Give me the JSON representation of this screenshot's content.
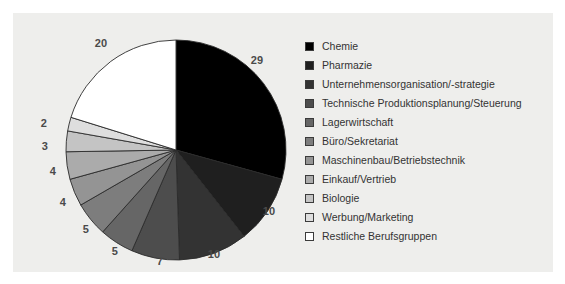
{
  "card": {
    "background_color": "#eeeeec",
    "page_background_color": "#ffffff"
  },
  "chart_data": {
    "type": "pie",
    "title": "",
    "subtitle": "",
    "xlabel": "",
    "ylabel": "",
    "grid": false,
    "legend_position": "right",
    "unit": "percent",
    "start_angle_deg": 0,
    "direction": "clockwise",
    "total": 99,
    "categories": [
      "Chemie",
      "Pharmazie",
      "Unternehmensorganisation/-strategie",
      "Technische Produktionsplanung/Steuerung",
      "Lagerwirtschaft",
      "Büro/Sekretariat",
      "Maschinenbau/Betriebstechnik",
      "Einkauf/Vertrieb",
      "Biologie",
      "Werbung/Marketing",
      "Restliche Berufsgruppen"
    ],
    "values": [
      29,
      10,
      10,
      7,
      5,
      5,
      4,
      4,
      3,
      2,
      20
    ],
    "colors": [
      "#000000",
      "#1f1f1f",
      "#333333",
      "#4d4d4d",
      "#666666",
      "#7d7d7d",
      "#949494",
      "#ababab",
      "#c4c4c4",
      "#dedede",
      "#ffffff"
    ],
    "slice_border_color": "#2b2b2b",
    "label_color": "#4a4a4a",
    "data_labels": [
      {
        "text": "29",
        "x": 244,
        "y": 47
      },
      {
        "text": "10",
        "x": 256,
        "y": 198
      },
      {
        "text": "10",
        "x": 201,
        "y": 241
      },
      {
        "text": "7",
        "x": 147,
        "y": 248
      },
      {
        "text": "5",
        "x": 102,
        "y": 238
      },
      {
        "text": "5",
        "x": 73,
        "y": 216
      },
      {
        "text": "4",
        "x": 50,
        "y": 189
      },
      {
        "text": "4",
        "x": 40,
        "y": 158
      },
      {
        "text": "3",
        "x": 32,
        "y": 133
      },
      {
        "text": "2",
        "x": 31,
        "y": 110
      },
      {
        "text": "20",
        "x": 88,
        "y": 30
      }
    ],
    "geometry": {
      "center_x": 163,
      "center_y": 137,
      "radius": 110
    }
  },
  "legend": {
    "items": [
      {
        "label": "Chemie",
        "color": "#000000"
      },
      {
        "label": "Pharmazie",
        "color": "#1f1f1f"
      },
      {
        "label": "Unternehmensorganisation/-strategie",
        "color": "#333333"
      },
      {
        "label": "Technische Produktionsplanung/Steuerung",
        "color": "#4d4d4d"
      },
      {
        "label": "Lagerwirtschaft",
        "color": "#666666"
      },
      {
        "label": "Büro/Sekretariat",
        "color": "#7d7d7d"
      },
      {
        "label": "Maschinenbau/Betriebstechnik",
        "color": "#949494"
      },
      {
        "label": "Einkauf/Vertrieb",
        "color": "#ababab"
      },
      {
        "label": "Biologie",
        "color": "#c4c4c4"
      },
      {
        "label": "Werbung/Marketing",
        "color": "#dedede"
      },
      {
        "label": "Restliche Berufsgruppen",
        "color": "#ffffff"
      }
    ]
  }
}
